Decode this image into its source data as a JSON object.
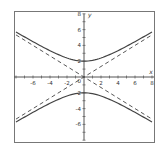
{
  "chart_data": {
    "type": "line",
    "title": "",
    "xlabel": "x",
    "ylabel": "y",
    "xlim": [
      -8,
      8
    ],
    "ylim": [
      -8,
      8
    ],
    "grid": false,
    "x_ticks": [
      -6,
      -4,
      -2,
      2,
      4,
      6,
      8
    ],
    "y_ticks": [
      8,
      6,
      4,
      2,
      -2,
      -4,
      -6
    ],
    "origin_label": "0",
    "series": [
      {
        "name": "hyperbola upper branch",
        "style": "solid",
        "equation": "y = 2*sqrt(1 + x^2/9)",
        "x": [
          -8,
          -6,
          -4,
          -2,
          0,
          2,
          4,
          6,
          8
        ],
        "y": [
          5.7,
          4.47,
          3.33,
          2.4,
          2,
          2.4,
          3.33,
          4.47,
          5.7
        ]
      },
      {
        "name": "hyperbola lower branch",
        "style": "solid",
        "equation": "y = -2*sqrt(1 + x^2/9)",
        "x": [
          -8,
          -6,
          -4,
          -2,
          0,
          2,
          4,
          6,
          8
        ],
        "y": [
          -5.7,
          -4.47,
          -3.33,
          -2.4,
          -2,
          -2.4,
          -3.33,
          -4.47,
          -5.7
        ]
      },
      {
        "name": "asymptote",
        "style": "dashed",
        "equation": "y = (2/3)x",
        "x": [
          -8,
          8
        ],
        "y": [
          -5.33,
          5.33
        ]
      },
      {
        "name": "asymptote",
        "style": "dashed",
        "equation": "y = -(2/3)x",
        "x": [
          -8,
          8
        ],
        "y": [
          5.33,
          -5.33
        ]
      }
    ]
  },
  "colors": {
    "curve": "#444444",
    "axis": "#555555",
    "frame": "#777777"
  }
}
